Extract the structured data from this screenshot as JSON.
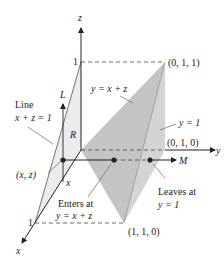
{
  "figure": {
    "axes": {
      "z_label": "z",
      "y_label": "y",
      "x_label": "x",
      "z_tick": "1",
      "x_tick": "1"
    },
    "points": {
      "p011": "(0, 1, 1)",
      "p010": "(0, 1, 0)",
      "p110": "(1, 1, 0)",
      "xz": "(x, z)"
    },
    "labels": {
      "plane_eq": "y = x + z",
      "plane_y1": "y = 1",
      "line_title": "Line",
      "line_eq": "x + z = 1",
      "L": "L",
      "R": "R",
      "M": "M",
      "x_small": "x",
      "enters_line1": "Enters at",
      "enters_line2": "y = x + z",
      "leaves_line1": "Leaves at",
      "leaves_line2": "y = 1"
    },
    "colors": {
      "shade_dark": "#bdbdbd",
      "shade_light": "#e6e6e6",
      "line": "#222222",
      "dash": "#444444",
      "leader": "#777777"
    }
  }
}
